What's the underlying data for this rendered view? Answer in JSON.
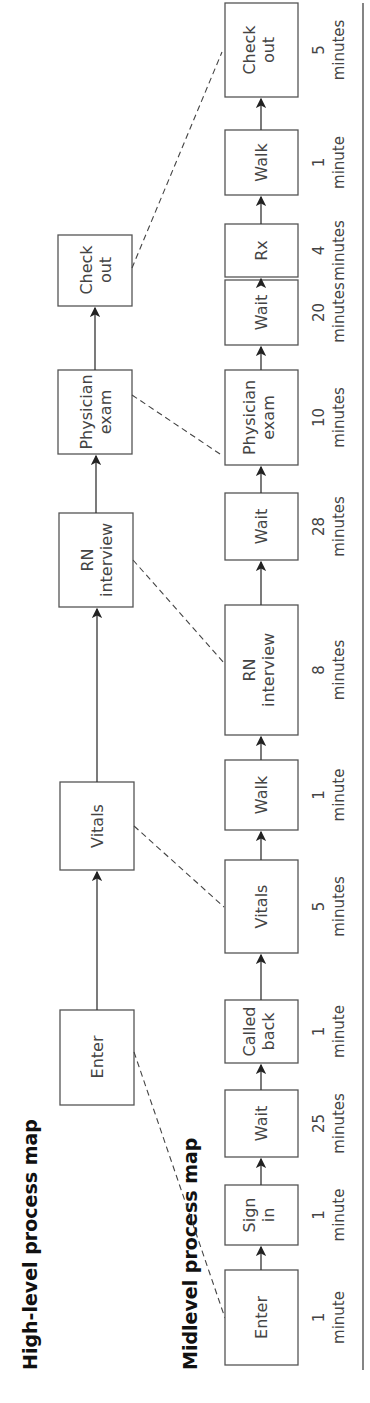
{
  "titles": {
    "high": "High-level process map",
    "mid": "Midlevel process map"
  },
  "high_level": [
    {
      "l1": "Enter",
      "l2": ""
    },
    {
      "l1": "Vitals",
      "l2": ""
    },
    {
      "l1": "RN",
      "l2": "interview"
    },
    {
      "l1": "Physician",
      "l2": "exam"
    },
    {
      "l1": "Check",
      "l2": "out"
    }
  ],
  "mid_level": [
    {
      "l1": "Enter",
      "l2": "",
      "n": "1",
      "u": "minute"
    },
    {
      "l1": "Sign",
      "l2": "in",
      "n": "1",
      "u": "minute"
    },
    {
      "l1": "Wait",
      "l2": "",
      "n": "25",
      "u": "minutes"
    },
    {
      "l1": "Called",
      "l2": "back",
      "n": "1",
      "u": "minute"
    },
    {
      "l1": "Vitals",
      "l2": "",
      "n": "5",
      "u": "minutes"
    },
    {
      "l1": "Walk",
      "l2": "",
      "n": "1",
      "u": "minute"
    },
    {
      "l1": "RN",
      "l2": "interview",
      "n": "8",
      "u": "minutes"
    },
    {
      "l1": "Wait",
      "l2": "",
      "n": "28",
      "u": "minutes"
    },
    {
      "l1": "Physician",
      "l2": "exam",
      "n": "10",
      "u": "minutes"
    },
    {
      "l1": "Wait",
      "l2": "",
      "n": "20",
      "u": "minutes"
    },
    {
      "l1": "Rx",
      "l2": "",
      "n": "4",
      "u": "minutes"
    },
    {
      "l1": "Walk",
      "l2": "",
      "n": "1",
      "u": "minute"
    },
    {
      "l1": "Check",
      "l2": "out",
      "n": "5",
      "u": "minutes"
    }
  ]
}
